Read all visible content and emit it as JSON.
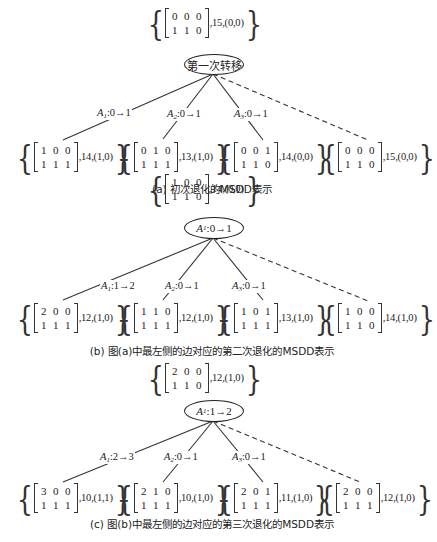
{
  "panels": [
    {
      "id": "a",
      "root": {
        "matrix": [
          [
            "0",
            "0",
            "0"
          ],
          [
            "1",
            "1",
            "0"
          ]
        ],
        "suffix": ",15,(0,0)"
      },
      "node_label": "第一次转移",
      "edges": [
        {
          "var": "A",
          "sub": "1",
          "text": ":0→1",
          "style": "solid"
        },
        {
          "var": "A",
          "sub": "2",
          "text": ":0→1",
          "style": "solid"
        },
        {
          "var": "A",
          "sub": "3",
          "text": ":0→1",
          "style": "solid"
        },
        {
          "var": "",
          "sub": "",
          "text": "",
          "style": "dashed"
        }
      ],
      "children": [
        {
          "matrix": [
            [
              "1",
              "0",
              "0"
            ],
            [
              "1",
              "1",
              "1"
            ]
          ],
          "suffix": ",14,(1,0)"
        },
        {
          "matrix": [
            [
              "0",
              "1",
              "0"
            ],
            [
              "1",
              "1",
              "1"
            ]
          ],
          "suffix": ",13,(1,0)"
        },
        {
          "matrix": [
            [
              "0",
              "0",
              "1"
            ],
            [
              "1",
              "1",
              "0"
            ]
          ],
          "suffix": ",14,(0,0)"
        },
        {
          "matrix": [
            [
              "0",
              "0",
              "0"
            ],
            [
              "1",
              "1",
              "0"
            ]
          ],
          "suffix": ",15,(0,0)"
        }
      ],
      "caption": "(a) 初次退化的MSDD表示"
    },
    {
      "id": "b",
      "root": {
        "matrix": [
          [
            "1",
            "0",
            "0"
          ],
          [
            "1",
            "1",
            "0"
          ]
        ],
        "suffix": ",14,(0,0)"
      },
      "node_label_var": "A",
      "node_label_sub": "1",
      "node_label_text": ":0→1",
      "edges": [
        {
          "var": "A",
          "sub": "1",
          "text": ":1→2",
          "style": "solid"
        },
        {
          "var": "A",
          "sub": "2",
          "text": ":0→1",
          "style": "solid"
        },
        {
          "var": "A",
          "sub": "3",
          "text": ":0→1",
          "style": "solid"
        },
        {
          "var": "",
          "sub": "",
          "text": "",
          "style": "dashed"
        }
      ],
      "children": [
        {
          "matrix": [
            [
              "2",
              "0",
              "0"
            ],
            [
              "1",
              "1",
              "1"
            ]
          ],
          "suffix": ",12,(1,0)"
        },
        {
          "matrix": [
            [
              "1",
              "1",
              "0"
            ],
            [
              "1",
              "1",
              "1"
            ]
          ],
          "suffix": ",12,(1,0)"
        },
        {
          "matrix": [
            [
              "1",
              "0",
              "1"
            ],
            [
              "1",
              "1",
              "1"
            ]
          ],
          "suffix": ",13,(1,0)"
        },
        {
          "matrix": [
            [
              "1",
              "0",
              "0"
            ],
            [
              "1",
              "1",
              "0"
            ]
          ],
          "suffix": ",14,(1,0)"
        }
      ],
      "caption": "(b) 图(a)中最左侧的边对应的第二次退化的MSDD表示"
    },
    {
      "id": "c",
      "root": {
        "matrix": [
          [
            "2",
            "0",
            "0"
          ],
          [
            "1",
            "1",
            "0"
          ]
        ],
        "suffix": ",12,(1,0)"
      },
      "node_label_var": "A",
      "node_label_sub": "1",
      "node_label_text": ":1→2",
      "edges": [
        {
          "var": "A",
          "sub": "1",
          "text": ":2→3",
          "style": "solid"
        },
        {
          "var": "A",
          "sub": "2",
          "text": ":0→1",
          "style": "solid"
        },
        {
          "var": "A",
          "sub": "3",
          "text": ":0→1",
          "style": "solid"
        },
        {
          "var": "",
          "sub": "",
          "text": "",
          "style": "dashed"
        }
      ],
      "children": [
        {
          "matrix": [
            [
              "3",
              "0",
              "0"
            ],
            [
              "1",
              "1",
              "1"
            ]
          ],
          "suffix": ",10,(1,1)"
        },
        {
          "matrix": [
            [
              "2",
              "1",
              "0"
            ],
            [
              "1",
              "1",
              "1"
            ]
          ],
          "suffix": ",10,(1,0)"
        },
        {
          "matrix": [
            [
              "2",
              "0",
              "1"
            ],
            [
              "1",
              "1",
              "1"
            ]
          ],
          "suffix": ",11,(1,0)"
        },
        {
          "matrix": [
            [
              "2",
              "0",
              "0"
            ],
            [
              "1",
              "1",
              "1"
            ]
          ],
          "suffix": ",12,(1,0)"
        }
      ],
      "caption": "(c) 图(b)中最左侧的边对应的第三次退化的MSDD表示"
    }
  ]
}
